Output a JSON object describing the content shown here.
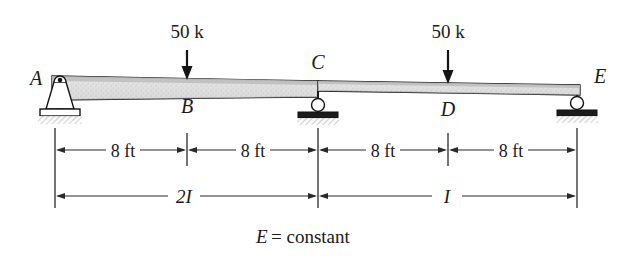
{
  "figure": {
    "kind": "structural-beam-diagram",
    "caption": {
      "symbol": "E",
      "equals_text": "= constant",
      "full_text": "E = constant"
    },
    "nodes": [
      {
        "id": "A",
        "label": "A",
        "x_px": 55,
        "support": "pin",
        "label_side": "left"
      },
      {
        "id": "B",
        "label": "B",
        "x_px": 187,
        "support": "none",
        "label_side": "below"
      },
      {
        "id": "C",
        "label": "C",
        "x_px": 318,
        "support": "roller",
        "label_side": "above"
      },
      {
        "id": "D",
        "label": "D",
        "x_px": 448,
        "support": "none",
        "label_side": "below"
      },
      {
        "id": "E",
        "label": "E",
        "x_px": 577,
        "support": "roller",
        "label_side": "right"
      }
    ],
    "loads": [
      {
        "at_node": "B",
        "label": "50 k",
        "magnitude": 50,
        "unit": "k",
        "direction": "down",
        "x_px": 187
      },
      {
        "at_node": "D",
        "label": "50 k",
        "magnitude": 50,
        "unit": "k",
        "direction": "down",
        "x_px": 448
      }
    ],
    "dimensions": [
      {
        "label": "8 ft",
        "value": 8,
        "unit": "ft",
        "from": "A",
        "to": "B",
        "x_start_px": 55,
        "x_end_px": 187
      },
      {
        "label": "8 ft",
        "value": 8,
        "unit": "ft",
        "from": "B",
        "to": "C",
        "x_start_px": 187,
        "x_end_px": 318
      },
      {
        "label": "8 ft",
        "value": 8,
        "unit": "ft",
        "from": "C",
        "to": "D",
        "x_start_px": 318,
        "x_end_px": 448
      },
      {
        "label": "8 ft",
        "value": 8,
        "unit": "ft",
        "from": "D",
        "to": "E",
        "x_start_px": 448,
        "x_end_px": 577
      }
    ],
    "stiffness_spans": [
      {
        "label": "2I",
        "from": "A",
        "to": "C",
        "x_start_px": 55,
        "x_end_px": 318
      },
      {
        "label": "I",
        "from": "C",
        "to": "E",
        "x_start_px": 318,
        "x_end_px": 577
      }
    ],
    "colors": {
      "background": "#ffffff",
      "ink": "#1a1a1a",
      "beam_fill_light": "#e8e8e8",
      "beam_fill_mid": "#d2d2d2",
      "shadow": "#cfcfcf"
    }
  }
}
